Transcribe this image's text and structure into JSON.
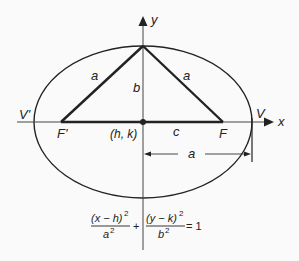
{
  "diagram": {
    "axes": {
      "x_label": "x",
      "y_label": "y"
    },
    "points": {
      "center": "(h, k)",
      "left_focus": "F'",
      "right_focus": "F",
      "left_vertex": "V'",
      "right_vertex": "V"
    },
    "segments": {
      "left_side": "a",
      "right_side": "a",
      "minor_semi_axis": "b",
      "focal_distance": "c",
      "major_semi_axis": "a"
    },
    "equation": {
      "num1": "(x − h)",
      "exp1": "2",
      "den1": "a",
      "dexp1": "2",
      "plus": "+",
      "num2": "(y − k)",
      "exp2": "2",
      "den2": "b",
      "dexp2": "2",
      "rhs": "= 1"
    },
    "colors": {
      "line": "#222222",
      "background": "#fafafa"
    }
  }
}
